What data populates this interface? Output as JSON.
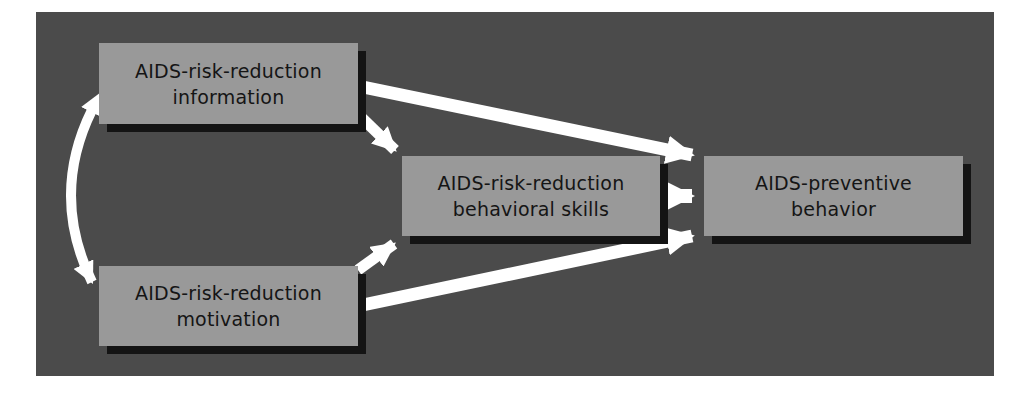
{
  "diagram": {
    "colors": {
      "background": "#4b4b4b",
      "box_fill": "#999999",
      "box_shadow": "#141414",
      "arrow": "#ffffff",
      "text": "#151515"
    },
    "nodes": [
      {
        "id": "information",
        "lines": [
          "AIDS-risk-reduction",
          "information"
        ]
      },
      {
        "id": "behavioral_skills",
        "lines": [
          "AIDS-risk-reduction",
          "behavioral skills"
        ]
      },
      {
        "id": "preventive_behavior",
        "lines": [
          "AIDS-preventive",
          "behavior"
        ]
      },
      {
        "id": "motivation",
        "lines": [
          "AIDS-risk-reduction",
          "motivation"
        ]
      }
    ],
    "edges": [
      {
        "from": "information",
        "to": "motivation",
        "type": "bidirectional-curved"
      },
      {
        "from": "information",
        "to": "behavioral_skills",
        "type": "directed"
      },
      {
        "from": "information",
        "to": "preventive_behavior",
        "type": "directed"
      },
      {
        "from": "motivation",
        "to": "behavioral_skills",
        "type": "directed"
      },
      {
        "from": "motivation",
        "to": "preventive_behavior",
        "type": "directed"
      },
      {
        "from": "behavioral_skills",
        "to": "preventive_behavior",
        "type": "directed"
      }
    ]
  }
}
